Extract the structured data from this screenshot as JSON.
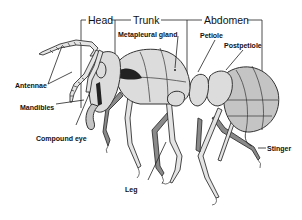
{
  "sections": [
    {
      "id": "head",
      "label": "Head"
    },
    {
      "id": "trunk",
      "label": "Trunk"
    },
    {
      "id": "abdomen",
      "label": "Abdomen"
    }
  ],
  "labels": {
    "metapleural_gland": "Metapleural gland",
    "petiole": "Petiole",
    "postpetiole": "Postpetiole",
    "antennae": "Antennae",
    "mandibles": "Mandibles",
    "compound_eye": "Compound eye",
    "leg": "Leg",
    "stinger": "Stinger"
  },
  "colors": {
    "outline": "#333333",
    "body_fill": "#dcdcdc",
    "dark_fill": "#8a8a8a",
    "background": "#ffffff"
  }
}
